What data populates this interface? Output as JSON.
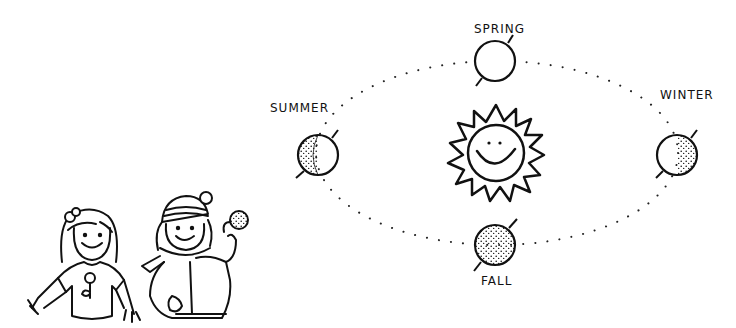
{
  "diagram": {
    "colors": {
      "ink": "#111111",
      "background": "#ffffff"
    },
    "center": {
      "name": "Sun",
      "icon": "smiling-sun-icon"
    },
    "seasons": [
      {
        "label": "SPRING",
        "position": "top",
        "phase": "full-light"
      },
      {
        "label": "SUMMER",
        "position": "left",
        "phase": "left-half-shaded"
      },
      {
        "label": "WINTER",
        "position": "right",
        "phase": "right-half-shaded"
      },
      {
        "label": "FALL",
        "position": "bottom",
        "phase": "fully-shaded"
      }
    ],
    "characters": [
      {
        "name": "girl-in-tshirt",
        "icon": "girl-summer-icon"
      },
      {
        "name": "child-in-winter-clothes",
        "icon": "child-winter-icon"
      }
    ]
  }
}
